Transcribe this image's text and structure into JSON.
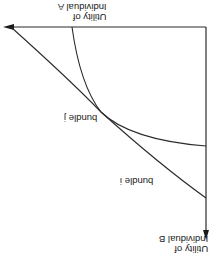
{
  "diagram": {
    "orientation": "rotated 180 degrees",
    "axes": {
      "vertical_label_line1": "Utility of",
      "vertical_label_line2": "Individual A",
      "horizontal_label_line1": "Utility of",
      "horizontal_label_line2": "Individual B"
    },
    "curves": [
      {
        "name": "bundle j",
        "label": "bundle j"
      },
      {
        "name": "bundle i",
        "label": "bundle i"
      }
    ],
    "colors": {
      "line": "#2a2a2a",
      "background": "#ffffff"
    }
  }
}
